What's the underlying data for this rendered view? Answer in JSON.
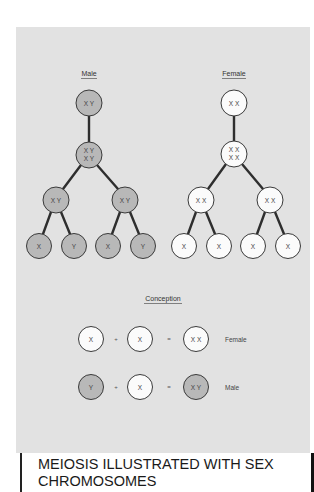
{
  "colors": {
    "panel_bg": "#e2e2e2",
    "male_fill": "#b8b8b8",
    "female_fill": "#fbfbfb",
    "stroke": "#3a3a3a",
    "edge": "#2e2e2e"
  },
  "male_tree": {
    "label": "Male",
    "nodes": [
      {
        "id": "m0",
        "text_line1": "X Y",
        "text_line2": "",
        "cx": 89,
        "cy": 103
      },
      {
        "id": "m1",
        "text_line1": "X Y",
        "text_line2": "X Y",
        "cx": 89,
        "cy": 155
      },
      {
        "id": "m2a",
        "text_line1": "X Y",
        "text_line2": "",
        "cx": 56,
        "cy": 200
      },
      {
        "id": "m2b",
        "text_line1": "X Y",
        "text_line2": "",
        "cx": 125,
        "cy": 200
      },
      {
        "id": "m3a",
        "text_line1": "X",
        "text_line2": "",
        "cx": 39,
        "cy": 246
      },
      {
        "id": "m3b",
        "text_line1": "Y",
        "text_line2": "",
        "cx": 74,
        "cy": 246
      },
      {
        "id": "m3c",
        "text_line1": "X",
        "text_line2": "",
        "cx": 108,
        "cy": 246
      },
      {
        "id": "m3d",
        "text_line1": "Y",
        "text_line2": "",
        "cx": 143,
        "cy": 246
      }
    ]
  },
  "female_tree": {
    "label": "Female",
    "nodes": [
      {
        "id": "f0",
        "text_line1": "X X",
        "text_line2": "",
        "cx": 234,
        "cy": 103
      },
      {
        "id": "f1",
        "text_line1": "X X",
        "text_line2": "X X",
        "cx": 234,
        "cy": 154
      },
      {
        "id": "f2a",
        "text_line1": "X X",
        "text_line2": "",
        "cx": 201,
        "cy": 200
      },
      {
        "id": "f2b",
        "text_line1": "X X",
        "text_line2": "",
        "cx": 270,
        "cy": 200
      },
      {
        "id": "f3a",
        "text_line1": "X",
        "text_line2": "",
        "cx": 184,
        "cy": 246
      },
      {
        "id": "f3b",
        "text_line1": "X",
        "text_line2": "",
        "cx": 219,
        "cy": 246
      },
      {
        "id": "f3c",
        "text_line1": "X",
        "text_line2": "",
        "cx": 253,
        "cy": 246
      },
      {
        "id": "f3d",
        "text_line1": "X",
        "text_line2": "",
        "cx": 288,
        "cy": 246
      }
    ]
  },
  "conception": {
    "label": "Conception",
    "rows": [
      {
        "a": "X",
        "a_sex": "female",
        "plus": "+",
        "b": "X",
        "b_sex": "female",
        "equals": "=",
        "result": "X X",
        "result_sex": "female",
        "outcome": "Female"
      },
      {
        "a": "Y",
        "a_sex": "male",
        "plus": "+",
        "b": "X",
        "b_sex": "female",
        "equals": "=",
        "result": "X Y",
        "result_sex": "male",
        "outcome": "Male"
      }
    ]
  },
  "caption": {
    "line1": "MEIOSIS ILLUSTRATED WITH SEX",
    "line2": "CHROMOSOMES"
  }
}
